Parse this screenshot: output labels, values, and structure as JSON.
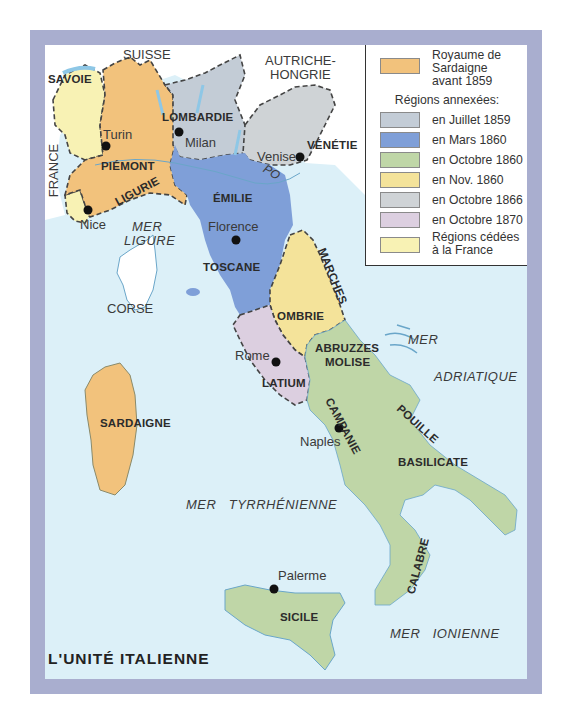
{
  "title": "L'UNITÉ ITALIENNE",
  "colors": {
    "frame": "#a9aecf",
    "sea": "#dcf0f8",
    "sardaigne_1859": "#f2c27c",
    "juillet_1859": "#c3ccd6",
    "mars_1860": "#7f9fd8",
    "octobre_1860": "#bfd6a7",
    "nov_1860": "#f4e39a",
    "octobre_1866": "#cfd3d6",
    "octobre_1870": "#dccfe0",
    "cedees_france": "#f8f2b4",
    "foreign": "#ffffff"
  },
  "legend": {
    "royaume": [
      "Royaume de",
      "Sardaigne",
      "avant 1859"
    ],
    "annexed_heading": "Régions annexées:",
    "items": [
      {
        "label": "en Juillet 1859",
        "color": "#c3ccd6"
      },
      {
        "label": "en Mars 1860",
        "color": "#7f9fd8"
      },
      {
        "label": "en Octobre 1860",
        "color": "#bfd6a7"
      },
      {
        "label": "en Nov. 1860",
        "color": "#f4e39a"
      },
      {
        "label": "en Octobre 1866",
        "color": "#cfd3d6"
      },
      {
        "label": "en Octobre 1870",
        "color": "#dccfe0"
      }
    ],
    "cedees": [
      "Régions cédées",
      "à la France"
    ]
  },
  "countries": {
    "suisse": "SUISSE",
    "autriche": [
      "AUTRICHE-",
      "HONGRIE"
    ],
    "france": "FRANCE"
  },
  "regions": {
    "savoie": "SAVOIE",
    "piemont": "PIÉMONT",
    "ligurie": "LIGURIE",
    "lombardie": "LOMBARDIE",
    "venetie": "VÉNÉTIE",
    "emilie": "ÉMILIE",
    "toscane": "TOSCANE",
    "marches": "MARCHES",
    "ombrie": "OMBRIE",
    "latium": "LATIUM",
    "abruzzes": [
      "ABRUZZES",
      "MOLISE"
    ],
    "campanie": "CAMPANIE",
    "pouille": "POUILLE",
    "basilicate": "BASILICATE",
    "calabre": "CALABRE",
    "sicile": "SICILE",
    "sardaigne": "SARDAIGNE",
    "corse": "CORSE"
  },
  "cities": {
    "turin": "Turin",
    "milan": "Milan",
    "venise": "Venise",
    "nice": "Nice",
    "florence": "Florence",
    "rome": "Rome",
    "naples": "Naples",
    "palerme": "Palerme"
  },
  "rivers": {
    "po": "PO"
  },
  "seas": {
    "ligure": [
      "MER",
      "LIGURE"
    ],
    "adriatique": [
      "MER",
      "ADRIATIQUE"
    ],
    "tyrrhenienne": "MER   TYRRHÉNIENNE",
    "ionienne": "MER   IONIENNE"
  }
}
